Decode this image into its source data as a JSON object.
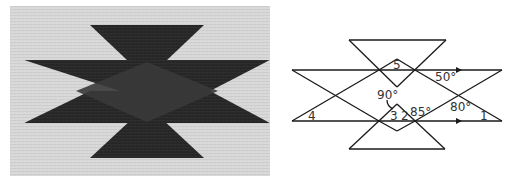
{
  "photo": {
    "description": "Woven rug pattern with dark star-like design of overlapping triangles",
    "colors": {
      "background": "#d9d9d9",
      "dark": "#262626",
      "center": "#3a3a3a"
    }
  },
  "diagram": {
    "labels": {
      "angle5": "5",
      "angle50": "50°",
      "angle90": "90°",
      "angle80": "80°",
      "angle85": "85°",
      "angle4": "4",
      "angle3": "3",
      "angle2": "2",
      "angle1": "1"
    }
  }
}
